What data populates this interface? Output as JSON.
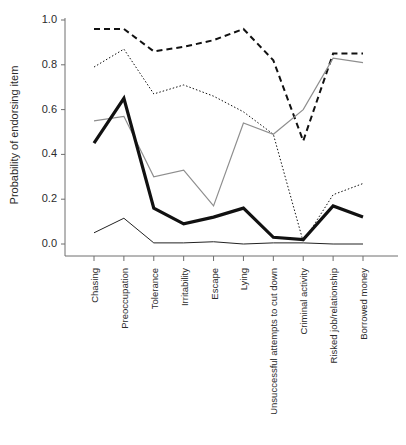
{
  "figure": {
    "title": "",
    "background_color": "#ffffff"
  },
  "axes": {
    "ylabel": "Probability of endorsing item",
    "xlabel": "",
    "yticks": [
      "0.0",
      "0.2",
      "0.4",
      "0.6",
      "0.8",
      "1.0"
    ],
    "ytick_values": [
      0.0,
      0.2,
      0.4,
      0.6,
      0.8,
      1.0
    ],
    "ylim": [
      0.0,
      1.0
    ],
    "grid": false
  },
  "chart_data": {
    "type": "line",
    "title": "",
    "xlabel": "",
    "ylabel": "Probability of endorsing item",
    "ylim": [
      0.0,
      1.0
    ],
    "grid": false,
    "legend_position": "none",
    "categories": [
      "Chasing",
      "Preoccupation",
      "Tolerance",
      "Irritability",
      "Escape",
      "Lying",
      "Unsuccessful attempts to cut down",
      "Criminal activity",
      "Risked job/relationship",
      "Borrowed money"
    ],
    "series": [
      {
        "name": "class-1-thick-dashed",
        "style": "thick-dashed",
        "color": "#111111",
        "stroke_width": 2.0,
        "dash": "6,4",
        "values": [
          0.96,
          0.96,
          0.86,
          0.88,
          0.91,
          0.96,
          0.82,
          0.46,
          0.85,
          0.85
        ]
      },
      {
        "name": "class-2-fine-dotted",
        "style": "fine-dotted",
        "color": "#111111",
        "stroke_width": 1.0,
        "dash": "1.5,2",
        "values": [
          0.79,
          0.87,
          0.67,
          0.71,
          0.66,
          0.59,
          0.49,
          0.01,
          0.22,
          0.27
        ]
      },
      {
        "name": "class-3-gray-solid",
        "style": "gray-solid",
        "color": "#8e8e8e",
        "stroke_width": 1.2,
        "dash": "none",
        "values": [
          0.55,
          0.57,
          0.3,
          0.33,
          0.17,
          0.54,
          0.49,
          0.6,
          0.83,
          0.81
        ]
      },
      {
        "name": "class-4-thick-black-solid",
        "style": "thick-solid",
        "color": "#111111",
        "stroke_width": 3.2,
        "dash": "none",
        "values": [
          0.45,
          0.65,
          0.16,
          0.09,
          0.12,
          0.16,
          0.03,
          0.02,
          0.17,
          0.12
        ]
      },
      {
        "name": "class-5-thin-black-solid",
        "style": "thin-solid",
        "color": "#222222",
        "stroke_width": 1.0,
        "dash": "none",
        "values": [
          0.05,
          0.115,
          0.005,
          0.005,
          0.01,
          0.0,
          0.005,
          0.005,
          0.0,
          0.0
        ]
      }
    ]
  }
}
